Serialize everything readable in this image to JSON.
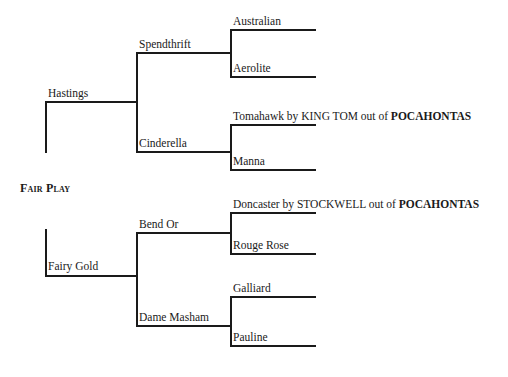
{
  "pedigree": {
    "subject": "Fair Play",
    "sire": {
      "name": "Hastings",
      "sire": {
        "name": "Spendthrift",
        "sire": {
          "name": "Australian"
        },
        "dam": {
          "name": "Aerolite"
        }
      },
      "dam": {
        "name": "Cinderella",
        "sire": {
          "name": "Tomahawk",
          "note_by": " by KING TOM out of ",
          "note_dam": "POCAHONTAS"
        },
        "dam": {
          "name": "Manna"
        }
      }
    },
    "dam": {
      "name": "Fairy Gold",
      "sire": {
        "name": "Bend Or",
        "sire": {
          "name": "Doncaster",
          "note_by": " by STOCKWELL out of ",
          "note_dam": "POCAHONTAS"
        },
        "dam": {
          "name": "Rouge Rose"
        }
      },
      "dam": {
        "name": "Dame Masham",
        "sire": {
          "name": "Galliard"
        },
        "dam": {
          "name": "Pauline"
        }
      }
    }
  },
  "colors": {
    "line": "#1a1a1a",
    "background": "#ffffff"
  }
}
